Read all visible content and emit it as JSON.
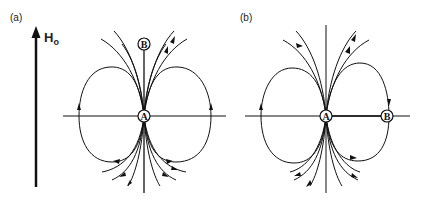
{
  "figure": {
    "panel_a": {
      "label": "(a)",
      "field_label": "H",
      "field_subscript": "o",
      "point_a": "A",
      "point_b": "B",
      "b_position": "above A on vertical axis"
    },
    "panel_b": {
      "label": "(b)",
      "point_a": "A",
      "point_b": "B",
      "b_position": "right of A on horizontal axis"
    },
    "colors": {
      "ink": "#111111",
      "background": "#ffffff"
    }
  }
}
